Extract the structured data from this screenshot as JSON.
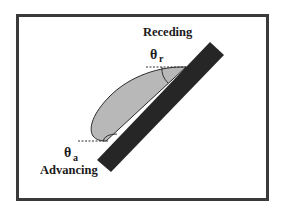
{
  "diagram": {
    "labels": {
      "receding": "Receding",
      "advancing": "Advancing",
      "theta_r": "θ",
      "theta_r_sub": "r",
      "theta_a": "θ",
      "theta_a_sub": "a"
    },
    "colors": {
      "frame": "#3a3a3a",
      "plate": "#262626",
      "droplet_fill": "#b8b8b8",
      "droplet_stroke": "#2a2a2a",
      "background": "#ffffff"
    }
  }
}
